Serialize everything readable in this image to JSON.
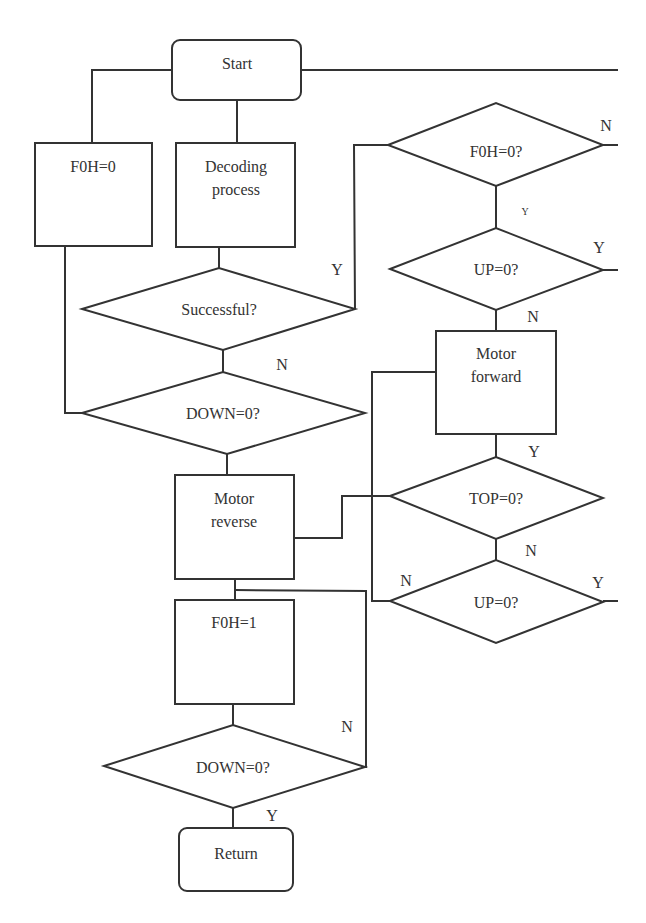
{
  "diagram": {
    "type": "flowchart",
    "nodes": {
      "start": {
        "label": "Start",
        "shape": "rounded-rect"
      },
      "f0h_set_0": {
        "label": "F0H=0",
        "shape": "rect"
      },
      "decoding": {
        "line1": "Decoding",
        "line2": "process",
        "shape": "rect"
      },
      "successful": {
        "label": "Successful?",
        "shape": "diamond"
      },
      "down_check_1": {
        "label": "DOWN=0?",
        "shape": "diamond"
      },
      "motor_reverse": {
        "line1": "Motor",
        "line2": "reverse",
        "shape": "rect"
      },
      "f0h_set_1": {
        "label": "F0H=1",
        "shape": "rect"
      },
      "down_check_2": {
        "label": "DOWN=0?",
        "shape": "diamond"
      },
      "return": {
        "label": "Return",
        "shape": "rounded-rect"
      },
      "f0h_check": {
        "label": "F0H=0?",
        "shape": "diamond"
      },
      "up_check_1": {
        "label": "UP=0?",
        "shape": "diamond"
      },
      "motor_forward": {
        "line1": "Motor",
        "line2": "forward",
        "shape": "rect"
      },
      "top_check": {
        "label": "TOP=0?",
        "shape": "diamond"
      },
      "up_check_2": {
        "label": "UP=0?",
        "shape": "diamond"
      }
    },
    "edge_labels": {
      "f0h_check_n": "N",
      "f0h_check_y": "Y",
      "up1_y": "Y",
      "up1_n": "N",
      "successful_y": "Y",
      "successful_n": "N",
      "forward_y": "Y",
      "top_n": "N",
      "up2_n": "N",
      "up2_y": "Y",
      "down2_n": "N",
      "down2_y": "Y"
    }
  }
}
